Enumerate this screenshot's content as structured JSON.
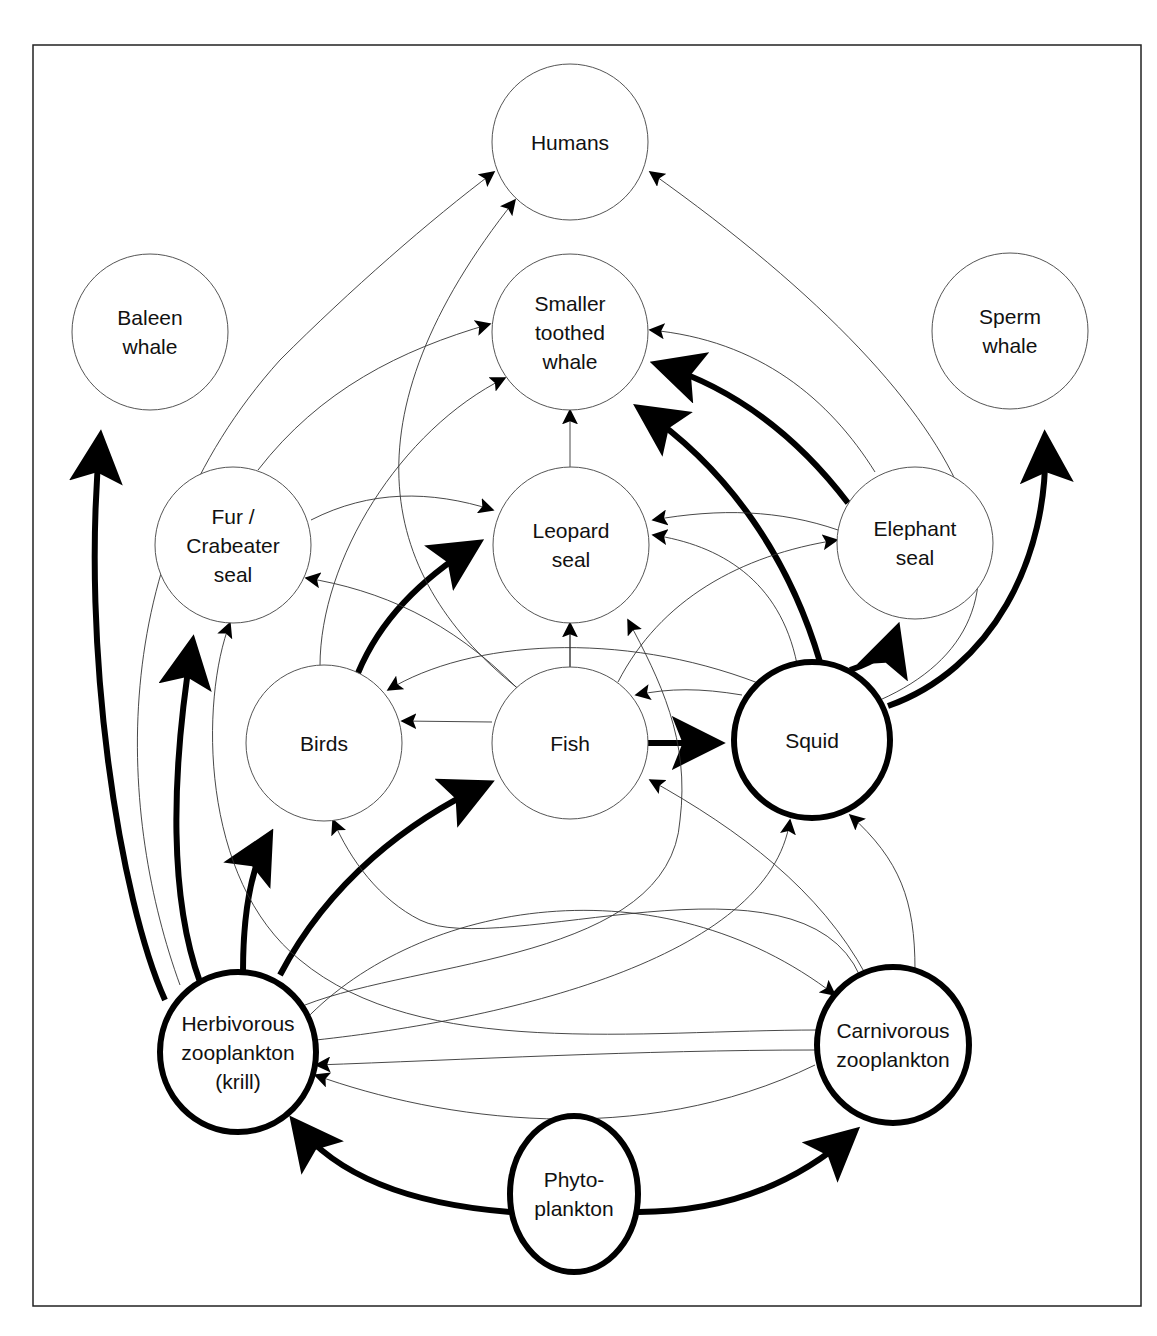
{
  "diagram": {
    "nodes": [
      {
        "id": "humans",
        "lines": [
          "Humans"
        ],
        "cx": 570,
        "cy": 142,
        "rx": 78,
        "ry": 78,
        "emphasis": false
      },
      {
        "id": "baleen",
        "lines": [
          "Baleen",
          "whale"
        ],
        "cx": 150,
        "cy": 332,
        "rx": 78,
        "ry": 78,
        "emphasis": false
      },
      {
        "id": "toothed",
        "lines": [
          "Smaller",
          "toothed",
          "whale"
        ],
        "cx": 570,
        "cy": 332,
        "rx": 78,
        "ry": 78,
        "emphasis": false
      },
      {
        "id": "sperm",
        "lines": [
          "Sperm",
          "whale"
        ],
        "cx": 1010,
        "cy": 331,
        "rx": 78,
        "ry": 78,
        "emphasis": false
      },
      {
        "id": "fur",
        "lines": [
          "Fur /",
          "Crabeater",
          "seal"
        ],
        "cx": 233,
        "cy": 545,
        "rx": 78,
        "ry": 78,
        "emphasis": false
      },
      {
        "id": "leopard",
        "lines": [
          "Leopard",
          "seal"
        ],
        "cx": 571,
        "cy": 545,
        "rx": 78,
        "ry": 78,
        "emphasis": false
      },
      {
        "id": "elephant",
        "lines": [
          "Elephant",
          "seal"
        ],
        "cx": 915,
        "cy": 543,
        "rx": 78,
        "ry": 76,
        "emphasis": false
      },
      {
        "id": "birds",
        "lines": [
          "Birds"
        ],
        "cx": 324,
        "cy": 743,
        "rx": 78,
        "ry": 78,
        "emphasis": false
      },
      {
        "id": "fish",
        "lines": [
          "Fish"
        ],
        "cx": 570,
        "cy": 743,
        "rx": 78,
        "ry": 76,
        "emphasis": false
      },
      {
        "id": "squid",
        "lines": [
          "Squid"
        ],
        "cx": 812,
        "cy": 740,
        "rx": 78,
        "ry": 78,
        "emphasis": true
      },
      {
        "id": "herb",
        "lines": [
          "Herbivorous",
          "zooplankton",
          "(krill)"
        ],
        "cx": 238,
        "cy": 1052,
        "rx": 78,
        "ry": 80,
        "emphasis": true
      },
      {
        "id": "carn",
        "lines": [
          "Carnivorous",
          "zooplankton"
        ],
        "cx": 893,
        "cy": 1045,
        "rx": 76,
        "ry": 78,
        "emphasis": true
      },
      {
        "id": "phyto",
        "lines": [
          "Phyto-",
          "plankton"
        ],
        "cx": 574,
        "cy": 1194,
        "rx": 64,
        "ry": 78,
        "emphasis": true
      }
    ],
    "edges": [
      {
        "from": "phyto",
        "to": "herb",
        "weight": "strong",
        "d": "M 510 1212 C 420 1205 340 1180 296 1124"
      },
      {
        "from": "phyto",
        "to": "carn",
        "weight": "strong",
        "d": "M 638 1212 C 730 1212 800 1180 852 1134"
      },
      {
        "from": "herb",
        "to": "baleen",
        "weight": "strong",
        "d": "M 165 1000 C 120 900 80 650 100 440"
      },
      {
        "from": "herb",
        "to": "fur",
        "weight": "strong",
        "d": "M 200 982 C 170 900 170 780 192 645"
      },
      {
        "from": "herb",
        "to": "birds",
        "weight": "strong",
        "d": "M 243 972 C 243 920 250 870 268 838"
      },
      {
        "from": "herb",
        "to": "fish",
        "weight": "strong",
        "d": "M 280 975 C 330 880 410 820 485 785"
      },
      {
        "from": "fish",
        "to": "squid",
        "weight": "strong",
        "d": "M 648 743 L 715 743"
      },
      {
        "from": "birds",
        "to": "leopard",
        "weight": "strong",
        "d": "M 358 673 C 380 620 420 580 475 545"
      },
      {
        "from": "squid",
        "to": "toothed",
        "weight": "strong",
        "d": "M 820 662 C 790 560 730 470 642 410"
      },
      {
        "from": "squid",
        "to": "elephant",
        "weight": "strong",
        "d": "M 850 670 C 880 660 890 650 896 632"
      },
      {
        "from": "squid",
        "to": "sperm",
        "weight": "strong",
        "d": "M 888 706 C 990 670 1050 560 1045 440"
      },
      {
        "from": "elephant",
        "to": "toothed",
        "weight": "strong",
        "d": "M 848 503 C 800 440 740 390 660 365"
      },
      {
        "from": "herb",
        "to": "humans",
        "weight": "weak",
        "d": "M 180 985 C 120 820 100 560 280 360 C 350 290 430 220 494 172"
      },
      {
        "from": "fish",
        "to": "humans",
        "weight": "weak",
        "d": "M 520 690 C 380 580 340 420 515 200"
      },
      {
        "from": "squid",
        "to": "humans",
        "weight": "weak",
        "d": "M 880 700 C 1060 620 1000 420 650 172"
      },
      {
        "from": "fur",
        "to": "toothed",
        "weight": "weak",
        "d": "M 258 470 C 320 390 400 350 490 324"
      },
      {
        "from": "birds",
        "to": "toothed",
        "weight": "weak",
        "d": "M 320 666 C 320 560 400 430 505 378"
      },
      {
        "from": "fish",
        "to": "toothed",
        "weight": "weak",
        "d": "M 570 667 L 570 410"
      },
      {
        "from": "elephant",
        "to": "toothed",
        "weight": "weak",
        "d": "M 875 472 C 830 400 760 340 650 330"
      },
      {
        "from": "fur",
        "to": "leopard",
        "weight": "weak",
        "d": "M 311 520 C 370 490 430 490 493 510"
      },
      {
        "from": "elephant",
        "to": "leopard",
        "weight": "weak",
        "d": "M 838 530 C 780 510 720 508 653 520"
      },
      {
        "from": "squid",
        "to": "leopard",
        "weight": "weak",
        "d": "M 797 664 C 780 580 720 545 653 535"
      },
      {
        "from": "fish",
        "to": "leopard",
        "weight": "weak",
        "d": "M 570 667 L 570 623"
      },
      {
        "from": "fish",
        "to": "elephant",
        "weight": "weak",
        "d": "M 618 682 C 660 600 740 555 837 540"
      },
      {
        "from": "fish",
        "to": "fur",
        "weight": "weak",
        "d": "M 517 688 C 450 620 380 590 306 578"
      },
      {
        "from": "squid",
        "to": "birds",
        "weight": "weak",
        "d": "M 758 683 C 620 630 470 640 388 690"
      },
      {
        "from": "fish",
        "to": "birds",
        "weight": "weak",
        "d": "M 492 722 L 402 721"
      },
      {
        "from": "squid",
        "to": "fish",
        "weight": "weak",
        "d": "M 742 695 C 700 688 670 688 636 695"
      },
      {
        "from": "herb",
        "to": "leopard",
        "weight": "weak",
        "d": "M 305 1005 C 420 960 670 960 680 820 C 690 740 660 680 628 620"
      },
      {
        "from": "carn",
        "to": "fur",
        "weight": "weak",
        "d": "M 818 1030 C 640 1030 420 1060 300 960 C 200 880 200 700 230 623"
      },
      {
        "from": "carn",
        "to": "birds",
        "weight": "weak",
        "d": "M 860 976 C 800 840 500 960 420 920 C 380 900 350 860 333 820"
      },
      {
        "from": "carn",
        "to": "fish",
        "weight": "weak",
        "d": "M 866 975 C 820 890 740 830 650 780"
      },
      {
        "from": "carn",
        "to": "squid",
        "weight": "weak",
        "d": "M 915 970 C 915 900 900 860 850 815"
      },
      {
        "from": "herb",
        "to": "carn",
        "weight": "weak",
        "d": "M 305 1020 C 420 900 660 860 835 995"
      },
      {
        "from": "herb",
        "to": "squid",
        "weight": "weak",
        "d": "M 316 1040 C 500 1020 770 960 790 820"
      },
      {
        "from": "carn",
        "to": "herb",
        "weight": "weak",
        "d": "M 815 1065 C 640 1150 440 1120 315 1075"
      },
      {
        "from": "carn",
        "to": "herb",
        "weight": "weak",
        "d": "M 815 1050 C 640 1050 460 1060 316 1065"
      }
    ]
  }
}
